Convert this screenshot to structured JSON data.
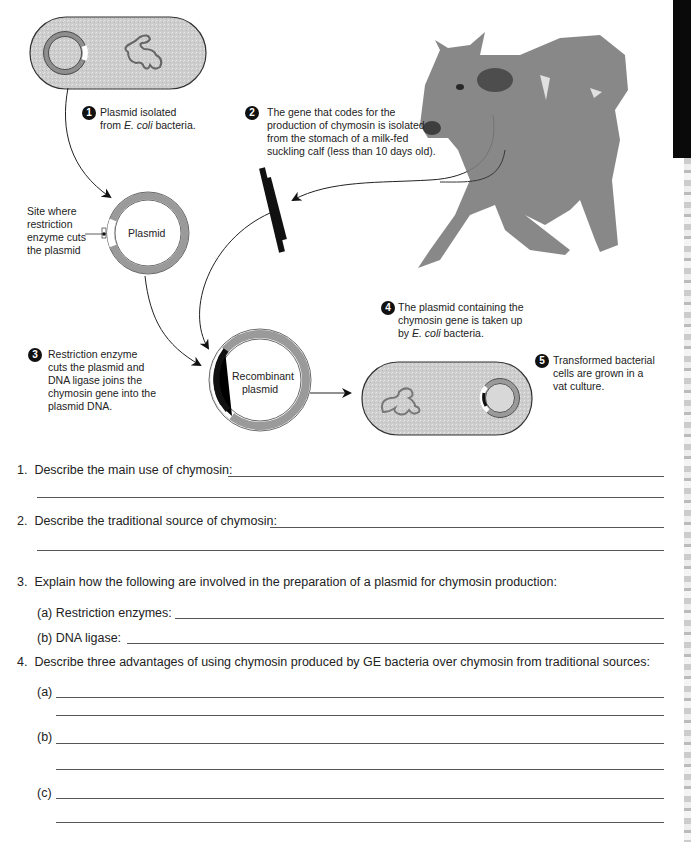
{
  "diagram": {
    "steps": [
      {
        "num": "1",
        "text_a": "Plasmid isolated",
        "text_b_pre": "from ",
        "text_b_italic": "E. coli",
        "text_b_post": " bacteria."
      },
      {
        "num": "2",
        "lines": [
          "The gene that codes for the",
          "production of chymosin is isolated",
          "from the stomach of a milk-fed",
          "suckling calf (less than 10 days old)."
        ]
      },
      {
        "num": "3",
        "lines": [
          "Restriction enzyme",
          "cuts the plasmid and",
          "DNA ligase joins the",
          "chymosin gene into the",
          "plasmid DNA."
        ]
      },
      {
        "num": "4",
        "line1": "The plasmid containing the",
        "line2": "chymosin gene is taken up",
        "line3_pre": "by ",
        "line3_italic": "E. coli",
        "line3_post": " bacteria."
      },
      {
        "num": "5",
        "lines": [
          "Transformed bacterial",
          "cells are grown in a",
          "vat culture."
        ]
      }
    ],
    "site_label": [
      "Site where",
      "restriction",
      "enzyme cuts",
      "the plasmid"
    ],
    "plasmid_label": "Plasmid",
    "recombinant_label": [
      "Recombinant",
      "plasmid"
    ],
    "colors": {
      "plasmid_ring": "#9a9a9a",
      "cell_fill": "#cfcfcf",
      "gene": "#111111"
    }
  },
  "questions": [
    {
      "num": "1.",
      "text": "Describe the main use of chymosin:"
    },
    {
      "num": "2.",
      "text": "Describe the traditional source of chymosin:"
    },
    {
      "num": "3.",
      "text": "Explain how the following are involved in the preparation of a plasmid for chymosin production:",
      "parts": [
        {
          "label": "(a) Restriction enzymes:"
        },
        {
          "label": "(b) DNA ligase:"
        }
      ]
    },
    {
      "num": "4.",
      "text": "Describe three advantages of using chymosin produced by GE bacteria over chymosin from traditional sources:",
      "parts": [
        {
          "label": "(a)"
        },
        {
          "label": "(b)"
        },
        {
          "label": "(c)"
        }
      ]
    }
  ]
}
